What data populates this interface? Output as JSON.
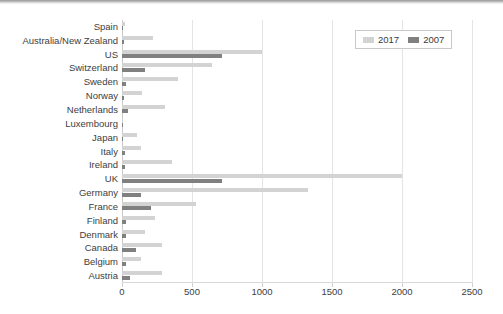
{
  "chart_data": {
    "type": "bar",
    "orientation": "horizontal",
    "title": "",
    "xlabel": "",
    "ylabel": "",
    "xlim": [
      0,
      2500
    ],
    "xticks": [
      0,
      500,
      1000,
      1500,
      2000,
      2500
    ],
    "grid": true,
    "legend_position": "top-right",
    "categories": [
      "Spain",
      "Australia/New Zealand",
      "US",
      "Switzerland",
      "Sweden",
      "Norway",
      "Netherlands",
      "Luxembourg",
      "Japan",
      "Italy",
      "Ireland",
      "UK",
      "Germany",
      "France",
      "Finland",
      "Denmark",
      "Canada",
      "Belgium",
      "Austria"
    ],
    "series": [
      {
        "name": "2017",
        "color": "#d3d3d3",
        "values": [
          20,
          220,
          1000,
          640,
          400,
          145,
          307,
          10,
          105,
          135,
          355,
          2000,
          1330,
          530,
          235,
          165,
          285,
          135,
          285
        ]
      },
      {
        "name": "2007",
        "color": "#808080",
        "values": [
          8,
          12,
          715,
          165,
          30,
          15,
          45,
          5,
          8,
          18,
          20,
          715,
          135,
          207,
          30,
          25,
          100,
          25,
          60
        ]
      }
    ],
    "tick_labels": [
      "0",
      "500",
      "1000",
      "1500",
      "2000",
      "2500"
    ],
    "legend_entries": [
      {
        "label": "2017",
        "color": "#d3d3d3"
      },
      {
        "label": "2007",
        "color": "#808080"
      }
    ]
  }
}
